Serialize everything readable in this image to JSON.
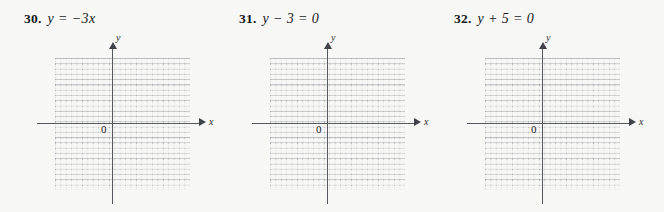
{
  "page": {
    "background_color": "#f7f7f5",
    "ink_color": "#16171a",
    "axis_color": "#55585f",
    "grid_color": "#96989f"
  },
  "problems": [
    {
      "number": "30.",
      "equation": "y = −3x",
      "graph": {
        "x_label": "x",
        "y_label": "y",
        "origin_label": "0"
      }
    },
    {
      "number": "31.",
      "equation": "y − 3 = 0",
      "graph": {
        "x_label": "x",
        "y_label": "y",
        "origin_label": "0"
      }
    },
    {
      "number": "32.",
      "equation": "y + 5 = 0",
      "graph": {
        "x_label": "x",
        "y_label": "y",
        "origin_label": "0"
      }
    }
  ],
  "chart_data": {
    "type": "scatter",
    "title": "",
    "xlabel": "x",
    "ylabel": "y",
    "grids": 3,
    "grid_on": true,
    "legend": "none",
    "xlim": [
      -5,
      5
    ],
    "ylim": [
      -5,
      5
    ],
    "series": [],
    "note": "Three empty dotted coordinate grids provided for graphing the equations y = -3x, y - 3 = 0, and y + 5 = 0. No data points are plotted."
  }
}
